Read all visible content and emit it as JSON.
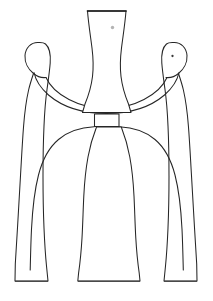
{
  "canvas": {
    "width": 213,
    "height": 301,
    "background_color": "#ffffff",
    "title": "Abstract line drawing of a tripod figure"
  },
  "style": {
    "outline_color": "#262626",
    "rim_color": "#1a1a1a",
    "base_color": "#4a4a4a",
    "eye_color": "#3a3a3a",
    "speck_color": "#b4b4b4",
    "fill_color": "#ffffff",
    "stroke_width": 1.05
  },
  "artwork": {
    "name": "tripod-figure-line-art",
    "description": "Symmetric outline drawing: a central flared column flanked by two slender side figures with rounded heads, their arms sweeping inward as a crescent, all joined at a small rectangular waist band above a wide arch and three flared feet.",
    "parts": [
      {
        "id": "center-column",
        "label": "Central flared column",
        "notes": "Hourglass / trumpet shaped neck, flat straight rim at top, widening at the shoulders"
      },
      {
        "id": "waist-band",
        "label": "Rectangular waist band",
        "notes": "Small rectangle joining the upper body to the lower arch"
      },
      {
        "id": "left-figure",
        "label": "Left side figure",
        "notes": "Slender tapering body with rounded head, no eye mark"
      },
      {
        "id": "right-figure",
        "label": "Right side figure",
        "notes": "Slender tapering body with rounded head and a small eye dot"
      },
      {
        "id": "arm-sweep",
        "label": "Crescent arm sweep",
        "notes": "Curved band running from the left head down across the body and up to the right head"
      },
      {
        "id": "lower-arch",
        "label": "Lower arch",
        "notes": "Wide rounded arch springing from the waist band down to the outer legs"
      },
      {
        "id": "center-leg",
        "label": "Center leg",
        "notes": "Flares outward to a wide flat foot"
      },
      {
        "id": "left-leg",
        "label": "Left leg",
        "notes": "Flares outward to a flat foot"
      },
      {
        "id": "right-leg",
        "label": "Right leg",
        "notes": "Flares outward to a flat foot"
      },
      {
        "id": "right-eye",
        "label": "Right figure eye dot"
      },
      {
        "id": "speck",
        "label": "Small gray speck on the column"
      }
    ],
    "baseline_y": 281,
    "feet": [
      {
        "id": "left-foot",
        "x_start": 15,
        "x_end": 48
      },
      {
        "id": "center-foot",
        "x_start": 78,
        "x_end": 140
      },
      {
        "id": "right-foot",
        "x_start": 164,
        "x_end": 197
      }
    ]
  }
}
